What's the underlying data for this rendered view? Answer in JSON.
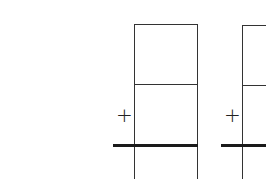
{
  "worksheet": {
    "problems": [
      {
        "operator": "+",
        "rows": [
          "",
          ""
        ],
        "answer": ""
      },
      {
        "operator": "+",
        "rows": [
          "",
          ""
        ],
        "answer": ""
      }
    ]
  },
  "colors": {
    "line": "#333333",
    "answer_line": "#1a1a1a",
    "background": "#ffffff"
  }
}
